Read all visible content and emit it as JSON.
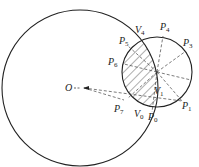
{
  "diagram": {
    "type": "geometry",
    "big_circle": {
      "cx": 80,
      "cy": 88,
      "r": 78
    },
    "small_circle": {
      "cx": 157,
      "cy": 72,
      "r": 35
    },
    "colors": {
      "stroke": "#222222",
      "dash": "#444444",
      "hatch": "#333333"
    },
    "labels": {
      "O": {
        "main": "O",
        "sub": ""
      },
      "V4": {
        "main": "V",
        "sub": "4"
      },
      "V1": {
        "main": "V",
        "sub": "1"
      },
      "V0": {
        "main": "V",
        "sub": "0"
      },
      "P0": {
        "main": "P",
        "sub": "0"
      },
      "P1": {
        "main": "P",
        "sub": "1"
      },
      "P3": {
        "main": "P",
        "sub": "3"
      },
      "P4": {
        "main": "P",
        "sub": "4"
      },
      "P5": {
        "main": "P",
        "sub": "5"
      },
      "P6": {
        "main": "P",
        "sub": "6"
      },
      "P7": {
        "main": "P",
        "sub": "7"
      }
    }
  }
}
